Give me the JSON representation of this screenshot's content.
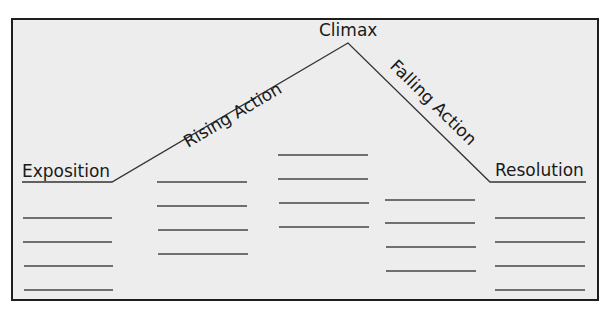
{
  "diagram": {
    "colors": {
      "background": "#ededed",
      "border": "#1e1e1e",
      "line": "#333333",
      "text": "#1a1a1a"
    },
    "plot_line_points": [
      [
        22,
        182
      ],
      [
        112,
        182
      ],
      [
        348,
        43
      ],
      [
        490,
        182
      ],
      [
        586,
        182
      ]
    ],
    "stages": [
      {
        "label": "Exposition",
        "blank_lines": 4
      },
      {
        "label": "Rising Action",
        "blank_lines": 4
      },
      {
        "label": "Climax",
        "blank_lines": 4
      },
      {
        "label": "Falling Action",
        "blank_lines": 4
      },
      {
        "label": "Resolution",
        "blank_lines": 4
      }
    ]
  }
}
